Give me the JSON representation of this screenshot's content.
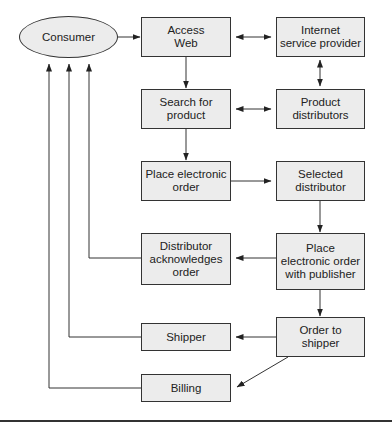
{
  "diagram": {
    "type": "flowchart",
    "nodes": {
      "consumer": "Consumer",
      "access_web": "Access\nWeb",
      "isp": "Internet\nservice provider",
      "search": "Search for\nproduct",
      "product_distributors": "Product\ndistributors",
      "place_order": "Place electronic\norder",
      "selected_distributor": "Selected\ndistributor",
      "distributor_ack": "Distributor\nacknowledges\norder",
      "place_order_publisher": "Place\nelectronic order\nwith publisher",
      "shipper": "Shipper",
      "order_to_shipper": "Order to\nshipper",
      "billing": "Billing"
    },
    "edges": [
      {
        "from": "consumer",
        "to": "access_web",
        "type": "arrow"
      },
      {
        "from": "access_web",
        "to": "isp",
        "type": "bidirectional"
      },
      {
        "from": "isp",
        "to": "product_distributors",
        "type": "bidirectional"
      },
      {
        "from": "access_web",
        "to": "search",
        "type": "arrow"
      },
      {
        "from": "search",
        "to": "product_distributors",
        "type": "bidirectional"
      },
      {
        "from": "search",
        "to": "place_order",
        "type": "arrow"
      },
      {
        "from": "place_order",
        "to": "selected_distributor",
        "type": "arrow"
      },
      {
        "from": "selected_distributor",
        "to": "place_order_publisher",
        "type": "arrow"
      },
      {
        "from": "place_order_publisher",
        "to": "distributor_ack",
        "type": "arrow"
      },
      {
        "from": "distributor_ack",
        "to": "consumer",
        "type": "arrow"
      },
      {
        "from": "place_order_publisher",
        "to": "order_to_shipper",
        "type": "arrow"
      },
      {
        "from": "order_to_shipper",
        "to": "shipper",
        "type": "arrow"
      },
      {
        "from": "shipper",
        "to": "consumer",
        "type": "arrow"
      },
      {
        "from": "order_to_shipper",
        "to": "billing",
        "type": "arrow"
      },
      {
        "from": "billing",
        "to": "consumer",
        "type": "arrow"
      }
    ]
  }
}
